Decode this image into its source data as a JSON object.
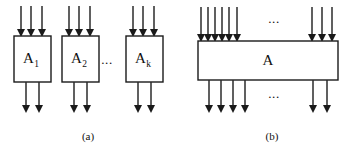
{
  "figure": {
    "width": 348,
    "height": 151,
    "background_color": "#ffffff",
    "line_color": "#2b2b2b",
    "box_stroke_color": "#1a1a1a",
    "box_fill_color": "#ffffff",
    "text_color": "#111111"
  },
  "panels": [
    {
      "id": "panel-a",
      "caption": "(a)",
      "caption_x": 88,
      "caption_y": 140,
      "ellipsis": [
        {
          "name": "panel-a-ellipsis",
          "text": "...",
          "x": 107,
          "y": 64
        }
      ],
      "boxes": [
        {
          "name": "module-a1",
          "label_main": "A",
          "label_sub": "1",
          "x": 14,
          "y": 36,
          "width": 37,
          "height": 46,
          "inputs_x": [
            21,
            31,
            42
          ],
          "outputs_x": [
            26,
            39
          ],
          "input_top_y": 6,
          "output_bottom_y": 113
        },
        {
          "name": "module-a2",
          "label_main": "A",
          "label_sub": "2",
          "x": 62,
          "y": 36,
          "width": 37,
          "height": 46,
          "inputs_x": [
            69,
            79,
            90
          ],
          "outputs_x": [
            74,
            87
          ],
          "input_top_y": 6,
          "output_bottom_y": 113
        },
        {
          "name": "module-ak",
          "label_main": "A",
          "label_sub": "k",
          "x": 126,
          "y": 36,
          "width": 37,
          "height": 46,
          "inputs_x": [
            133,
            143,
            154
          ],
          "outputs_x": [
            138,
            151
          ],
          "input_top_y": 6,
          "output_bottom_y": 113
        }
      ]
    },
    {
      "id": "panel-b",
      "caption": "(b)",
      "caption_x": 272,
      "caption_y": 140,
      "ellipsis": [
        {
          "name": "panel-b-top-ellipsis",
          "text": "...",
          "x": 274,
          "y": 23
        },
        {
          "name": "panel-b-bottom-ellipsis",
          "text": "...",
          "x": 274,
          "y": 98
        }
      ],
      "boxes": [
        {
          "name": "module-a-merged",
          "label_main": "A",
          "label_sub": "",
          "x": 198,
          "y": 41,
          "width": 140,
          "height": 39,
          "inputs_x": [
            201,
            208,
            215,
            222,
            229,
            237,
            312,
            322,
            332
          ],
          "outputs_x": [
            209,
            221,
            233,
            245,
            313,
            327
          ],
          "input_top_y": 7,
          "output_bottom_y": 113
        }
      ]
    }
  ],
  "geometry": {
    "arrow_head_half_width": 4,
    "arrow_head_length": 8,
    "line_stroke_width": 1.5,
    "box_stroke_width": 1.4
  }
}
